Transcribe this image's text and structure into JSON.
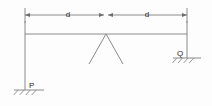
{
  "diagram": {
    "type": "structural-beam-diagram",
    "background_color": "#fdfdfd",
    "line_color": "#8a8a8a",
    "dim_line_color": "#6e6e6e",
    "text_color": "#2b2b2b",
    "dimensions": {
      "left_span": {
        "label": "d",
        "label_x": 68,
        "label_y": 15,
        "start_x": 25,
        "end_x": 104,
        "y": 15
      },
      "right_span": {
        "label": "d",
        "label_x": 147,
        "label_y": 15,
        "start_x": 108,
        "end_x": 187,
        "y": 15
      }
    },
    "beam": {
      "name": "horizontal-beam",
      "x1": 25,
      "x2": 187,
      "y": 34
    },
    "left_column": {
      "name": "left-column",
      "x": 25,
      "y1": 21,
      "y2": 90
    },
    "right_column": {
      "name": "right-column",
      "x": 187,
      "y1": 21,
      "y2": 58
    },
    "brace": {
      "name": "center-brace",
      "apex_x": 106,
      "apex_y": 34,
      "left_foot_x": 89,
      "left_foot_y": 64,
      "right_foot_x": 123,
      "right_foot_y": 64
    },
    "supports": [
      {
        "name": "support-p",
        "label": "P",
        "label_x": 29,
        "label_y": 86,
        "ground_x1": 14,
        "ground_x2": 44,
        "ground_y": 90,
        "hatch_count": 4
      },
      {
        "name": "support-q",
        "label": "Q",
        "label_x": 177,
        "label_y": 54,
        "ground_x1": 173,
        "ground_x2": 201,
        "ground_y": 58,
        "hatch_count": 4
      }
    ]
  }
}
